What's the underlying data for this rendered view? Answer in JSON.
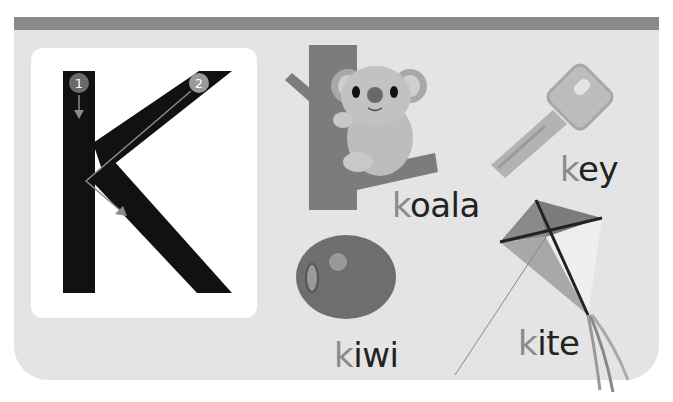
{
  "letter": "K",
  "stroke_numbers": [
    "1",
    "2"
  ],
  "words": [
    {
      "initial": "k",
      "rest": "oala",
      "full": "koala"
    },
    {
      "initial": "k",
      "rest": "ey",
      "full": "key"
    },
    {
      "initial": "k",
      "rest": "iwi",
      "full": "kiwi"
    },
    {
      "initial": "k",
      "rest": "ite",
      "full": "kite"
    }
  ],
  "colors": {
    "header": "#8a8a8a",
    "panel": "#e4e4e4",
    "initial": "#8a8a8a",
    "text": "#222222"
  }
}
